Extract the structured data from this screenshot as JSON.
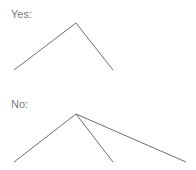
{
  "diagrams": [
    {
      "label": "Yes:",
      "apex": [
        76,
        23
      ],
      "branches": [
        [
          14,
          70
        ],
        [
          113,
          70
        ]
      ]
    },
    {
      "label": "No:",
      "apex": [
        76,
        114
      ],
      "branches": [
        [
          14,
          162
        ],
        [
          113,
          162
        ],
        [
          186,
          162
        ]
      ]
    }
  ],
  "colors": {
    "text": "#7a7a7a",
    "line": "#6e6e6e"
  }
}
